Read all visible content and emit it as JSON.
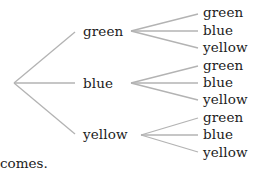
{
  "diagram": {
    "type": "tree-diagram",
    "line_color": "#b3b3b3",
    "root": {
      "children": [
        {
          "label": "green",
          "children": [
            "green",
            "blue",
            "yellow"
          ]
        },
        {
          "label": "blue",
          "children": [
            "green",
            "blue",
            "yellow"
          ]
        },
        {
          "label": "yellow",
          "children": [
            "green",
            "blue",
            "yellow"
          ]
        }
      ]
    }
  },
  "caption": "comes."
}
